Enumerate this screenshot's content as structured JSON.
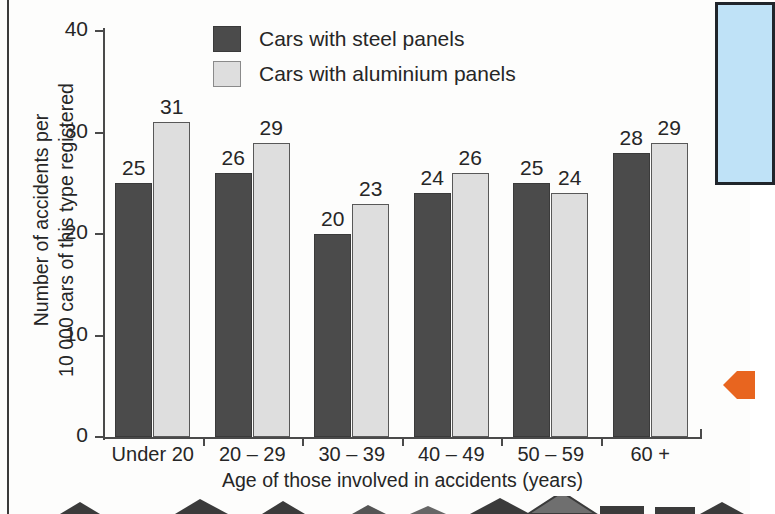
{
  "chart_data": {
    "type": "bar",
    "title": "",
    "xlabel": "Age of those involved in accidents (years)",
    "ylabel_line1": "Number of accidents per",
    "ylabel_line2": "10 000 cars of this type registered",
    "categories": [
      "Under 20",
      "20 – 29",
      "30 – 39",
      "40 – 49",
      "50 – 59",
      "60 +"
    ],
    "series": [
      {
        "name": "Cars with steel panels",
        "color": "#4b4b4b",
        "values": [
          25,
          26,
          20,
          24,
          25,
          28
        ]
      },
      {
        "name": "Cars with aluminium panels",
        "color": "#dedede",
        "values": [
          31,
          29,
          23,
          26,
          24,
          29
        ]
      }
    ],
    "ylim": [
      0,
      40
    ],
    "yticks": [
      0,
      10,
      20,
      30,
      40
    ],
    "ytick_labels": [
      "0",
      "10",
      "20",
      "30",
      "40"
    ],
    "grid": false,
    "legend_position": "top-center",
    "data_labels": true
  },
  "legend": {
    "items": [
      {
        "label": "Cars with steel panels",
        "swatch": "steel"
      },
      {
        "label": "Cars with aluminium panels",
        "swatch": "aluminium"
      }
    ]
  },
  "annotations": {
    "blue_callout_box": {
      "color": "#bfe2f7",
      "border": "#20252b"
    },
    "orange_arrow": {
      "color": "#e8651f",
      "direction": "left"
    }
  }
}
